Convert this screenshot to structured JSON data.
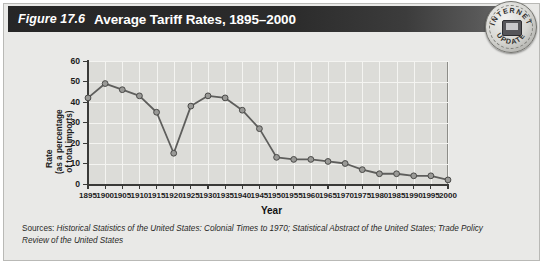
{
  "header": {
    "figure_number": "Figure 17.6",
    "title": "Average Tariff Rates, 1895–2000",
    "badge": {
      "top_text": "INTERNET",
      "bottom_text": "UPDATE",
      "icon": "computer-monitor-icon"
    }
  },
  "sources": {
    "label": "Sources: ",
    "text": "Historical Statistics of the United States: Colonial Times to 1970; Statistical Abstract of the United States; Trade Policy Review of the United States"
  },
  "colors": {
    "banner_dark": "#262626",
    "plot_background": "#dcdcd8",
    "panel_background": "#e9e9e7",
    "gridline": "#f4f4f1",
    "line": "#5e5e5c",
    "marker_fill": "#9a9a97",
    "marker_stroke": "#4a4a48",
    "axis": "#3a3a38"
  },
  "chart_data": {
    "type": "line",
    "title": "Average Tariff Rates, 1895–2000",
    "xlabel": "Year",
    "ylabel": "Rate (as a percentage of total imports)",
    "ylabel_line1": "Rate",
    "ylabel_line2": "(as a percentage",
    "ylabel_line3": "of total imports)",
    "xlim": [
      1895,
      2000
    ],
    "ylim": [
      0,
      60
    ],
    "yticks": [
      0,
      10,
      20,
      30,
      40,
      50,
      60
    ],
    "xticks": [
      1895,
      1900,
      1905,
      1910,
      1915,
      1920,
      1925,
      1930,
      1935,
      1940,
      1945,
      1950,
      1955,
      1960,
      1965,
      1970,
      1975,
      1980,
      1985,
      1990,
      1995,
      2000
    ],
    "grid": true,
    "legend": "none",
    "x": [
      1895,
      1900,
      1905,
      1910,
      1915,
      1920,
      1925,
      1930,
      1935,
      1940,
      1945,
      1950,
      1955,
      1960,
      1965,
      1970,
      1975,
      1980,
      1985,
      1990,
      1995,
      2000
    ],
    "values": [
      42,
      49,
      46,
      43,
      35,
      15,
      38,
      43,
      42,
      36,
      27,
      13,
      12,
      12,
      11,
      10,
      7,
      5,
      5,
      4,
      4,
      2
    ],
    "series": [
      {
        "name": "Average tariff rate",
        "values": [
          42,
          49,
          46,
          43,
          35,
          15,
          38,
          43,
          42,
          36,
          27,
          13,
          12,
          12,
          11,
          10,
          7,
          5,
          5,
          4,
          4,
          2
        ]
      }
    ]
  }
}
